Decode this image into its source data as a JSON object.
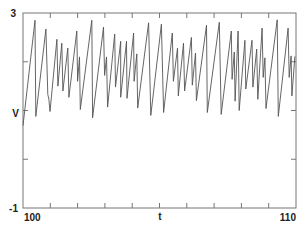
{
  "chart_data": {
    "type": "line",
    "title": "",
    "xlabel": "t",
    "ylabel": "V",
    "xlim": [
      100,
      110
    ],
    "ylim": [
      -1,
      3
    ],
    "x_tick_labels": [
      "100",
      "110"
    ],
    "y_tick_labels": [
      "3",
      "-1"
    ],
    "x_ticks_minor": [
      101,
      102,
      103,
      104,
      105,
      106,
      107,
      108,
      109
    ],
    "y_ticks_minor": [
      0,
      1,
      2
    ],
    "grid": false,
    "legend": null,
    "line_color": "#555555",
    "series": [
      {
        "name": "V",
        "x": [
          100.0,
          100.44,
          100.47,
          100.84,
          100.91,
          100.95,
          100.99,
          101.24,
          101.28,
          101.42,
          101.46,
          101.64,
          101.68,
          101.97,
          102.0,
          102.07,
          102.1,
          102.52,
          102.55,
          102.95,
          102.99,
          103.06,
          103.1,
          103.36,
          103.39,
          103.58,
          103.58,
          103.79,
          103.81,
          104.05,
          104.07,
          104.17,
          104.2,
          104.6,
          104.68,
          105.07,
          105.15,
          105.47,
          105.51,
          105.66,
          105.69,
          105.88,
          105.92,
          106.17,
          106.2,
          106.32,
          106.35,
          106.72,
          106.75,
          107.19,
          107.26,
          107.63,
          107.66,
          107.74,
          107.77,
          107.88,
          107.92,
          108.13,
          108.16,
          108.39,
          108.42,
          108.56,
          108.6,
          108.76,
          108.8,
          108.86,
          108.9,
          109.31,
          109.35,
          109.71,
          109.75,
          109.82,
          109.85,
          109.96
        ],
        "y": [
          0.69,
          2.85,
          0.88,
          2.67,
          1.33,
          1.23,
          0.98,
          2.46,
          1.5,
          2.38,
          1.4,
          2.28,
          1.27,
          2.63,
          1.6,
          2.1,
          1.02,
          2.85,
          0.85,
          2.71,
          1.72,
          2.1,
          1.07,
          2.57,
          1.48,
          2.42,
          1.27,
          2.42,
          1.25,
          2.59,
          1.6,
          2.16,
          1.05,
          2.8,
          0.9,
          2.77,
          0.96,
          2.59,
          1.6,
          2.28,
          1.3,
          2.38,
          1.4,
          2.5,
          1.52,
          2.18,
          1.2,
          2.75,
          0.96,
          2.81,
          0.92,
          2.63,
          1.64,
          2.2,
          1.19,
          2.63,
          1.0,
          2.44,
          1.44,
          2.44,
          1.48,
          2.26,
          1.23,
          2.69,
          1.68,
          2.08,
          1.04,
          2.86,
          0.88,
          2.69,
          1.68,
          2.12,
          1.3,
          2.11
        ]
      }
    ]
  },
  "axes": {
    "y_top_label": "3",
    "y_bottom_label": "-1",
    "y_axis_label": "V",
    "x_left_label": "100",
    "x_right_label": "110",
    "x_axis_label": "t"
  }
}
